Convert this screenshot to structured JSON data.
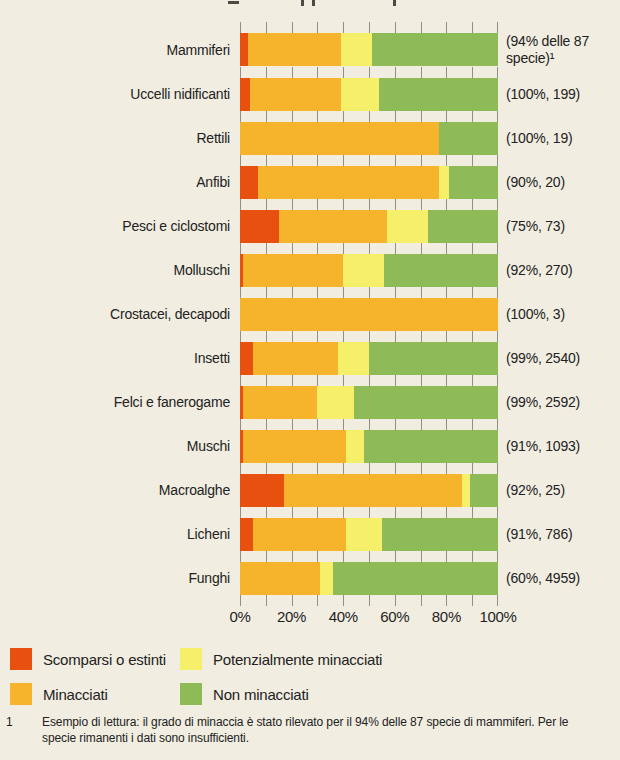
{
  "page": {
    "background": "#f1ede1"
  },
  "chart_data": {
    "type": "bar",
    "orientation": "horizontal",
    "stacked": true,
    "unit": "%",
    "xlim": [
      0,
      100
    ],
    "x_ticks": [
      "0%",
      "20%",
      "40%",
      "60%",
      "80%",
      "100%"
    ],
    "minor_tick_step_percent": 10,
    "grid": "tick-marks-between-bars",
    "categories": [
      "Mammiferi",
      "Uccelli nidificanti",
      "Rettili",
      "Anfibi",
      "Pesci e ciclostomi",
      "Molluschi",
      "Crostacei, decapodi",
      "Insetti",
      "Felci e fanerogame",
      "Muschi",
      "Macroalghe",
      "Licheni",
      "Funghi"
    ],
    "annotations": [
      "(94% delle 87 specie)¹",
      "(100%, 199)",
      "(100%, 19)",
      "(90%, 20)",
      "(75%, 73)",
      "(92%, 270)",
      "(100%, 3)",
      "(99%, 2540)",
      "(99%, 2592)",
      "(91%, 1093)",
      "(92%, 25)",
      "(91%, 786)",
      "(60%, 4959)"
    ],
    "series": [
      {
        "name": "Scomparsi o estinti",
        "color": "#e8500f",
        "values": [
          3,
          4,
          0,
          7,
          15,
          1,
          0,
          5,
          1,
          1,
          17,
          5,
          0
        ]
      },
      {
        "name": "Minacciati",
        "color": "#f6b42d",
        "values": [
          36,
          35,
          77,
          70,
          42,
          39,
          100,
          33,
          29,
          40,
          69,
          36,
          31
        ]
      },
      {
        "name": "Potenzialmente minacciati",
        "color": "#f5ef6a",
        "values": [
          12,
          15,
          0,
          4,
          16,
          16,
          0,
          12,
          14,
          7,
          3,
          14,
          5
        ]
      },
      {
        "name": "Non minacciati",
        "color": "#8ebb58",
        "values": [
          49,
          46,
          23,
          19,
          27,
          44,
          0,
          50,
          56,
          52,
          11,
          45,
          64
        ]
      }
    ],
    "legend_position": "bottom"
  },
  "legend": {
    "items": [
      {
        "label": "Scomparsi o estinti",
        "color": "#e8500f"
      },
      {
        "label": "Potenzialmente minacciati",
        "color": "#f5ef6a"
      },
      {
        "label": "Minacciati",
        "color": "#f6b42d"
      },
      {
        "label": "Non minacciati",
        "color": "#8ebb58"
      }
    ]
  },
  "footnote": {
    "marker": "1",
    "text": "Esempio di lettura: il grado di minaccia è stato rilevato per il 94% delle 87 specie di mammiferi. Per le specie rimanenti i dati sono insufficienti."
  }
}
